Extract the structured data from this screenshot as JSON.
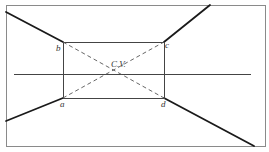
{
  "diagram": {
    "type": "one-point perspective",
    "colors": {
      "background": "#ffffff",
      "frame": "#8a8a8a",
      "thin_line": "#444444",
      "thick_line": "#1a1a1a",
      "dashed_line": "#555555",
      "label": "#333333"
    },
    "frame": {
      "x1": 6,
      "y1": 5,
      "x2": 265,
      "y2": 146
    },
    "horizon_line": {
      "x1": 14,
      "y1": 74,
      "x2": 251,
      "y2": 74
    },
    "rectangle": {
      "b": {
        "x": 63,
        "y": 42
      },
      "c": {
        "x": 164,
        "y": 42
      },
      "a": {
        "x": 63,
        "y": 98
      },
      "d": {
        "x": 164,
        "y": 98
      }
    },
    "center_of_vision": {
      "x": 113,
      "y": 70
    },
    "thick_lines": [
      {
        "name": "to-b",
        "x1": 6,
        "y1": 12,
        "x2": 63,
        "y2": 42
      },
      {
        "name": "to-c",
        "x1": 164,
        "y1": 42,
        "x2": 210,
        "y2": 5
      },
      {
        "name": "to-a",
        "x1": 6,
        "y1": 121,
        "x2": 63,
        "y2": 98
      },
      {
        "name": "to-d",
        "x1": 164,
        "y1": 98,
        "x2": 254,
        "y2": 146
      }
    ],
    "labels": {
      "a": "a",
      "b": "b",
      "c": "c",
      "d": "d",
      "cv": "C.V."
    }
  }
}
